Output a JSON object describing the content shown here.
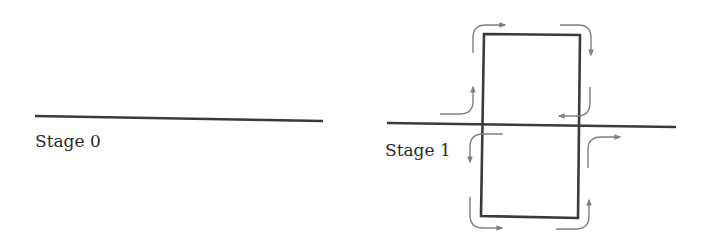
{
  "diagram": {
    "colors": {
      "line": "#3a3a3a",
      "arrow": "#808080",
      "background": "#ffffff"
    },
    "stages": [
      {
        "id": "stage-0",
        "label": "Stage 0",
        "description": "single horizontal line"
      },
      {
        "id": "stage-1",
        "label": "Stage 1",
        "description": "horizontal line crossed by a rectangular loop with circulating flow arrows at each corner and crossing"
      }
    ],
    "stage1_flow_arrows": [
      "top-left corner: up then right",
      "top-right corner: right then down",
      "right crossing above line: down then left",
      "right crossing below line: up then right",
      "bottom-right corner: right then up",
      "bottom-left corner: down then right",
      "left crossing below line: left then down",
      "left crossing above line: right then up"
    ]
  }
}
